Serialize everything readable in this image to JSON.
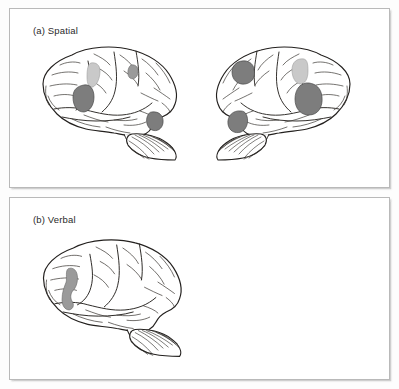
{
  "figure": {
    "background_color": "#fdfdfd",
    "panel_border_color": "#b9b9b9",
    "panel_background": "#ffffff"
  },
  "panels": [
    {
      "id": "spatial",
      "label": "(a) Spatial",
      "brain_count": 2,
      "brains": [
        {
          "id": "spatial-left-hemisphere",
          "view": "lateral",
          "facing": "right",
          "activations": [
            {
              "region": "superior-parietal",
              "shade": "light",
              "color": "#c9c9c9"
            },
            {
              "region": "inferior-parietal",
              "shade": "dark",
              "color": "#7d7d7d"
            },
            {
              "region": "premotor-dorsal",
              "shade": "mid",
              "color": "#9a9a9a"
            },
            {
              "region": "occipital-extrastriate",
              "shade": "dark",
              "color": "#7d7d7d"
            }
          ]
        },
        {
          "id": "spatial-right-hemisphere",
          "view": "lateral",
          "facing": "left",
          "activations": [
            {
              "region": "superior-parietal",
              "shade": "light",
              "color": "#c9c9c9"
            },
            {
              "region": "inferior-parietal",
              "shade": "dark",
              "color": "#7d7d7d"
            },
            {
              "region": "dorsolateral-prefrontal",
              "shade": "dark",
              "color": "#7d7d7d"
            },
            {
              "region": "occipital-extrastriate",
              "shade": "dark",
              "color": "#7d7d7d"
            }
          ]
        }
      ]
    },
    {
      "id": "verbal",
      "label": "(b) Verbal",
      "brain_count": 1,
      "brains": [
        {
          "id": "verbal-left-hemisphere",
          "view": "lateral",
          "facing": "right",
          "activations": [
            {
              "region": "broca-area-inferior-frontal",
              "shade": "mid",
              "color": "#9a9a9a"
            }
          ]
        }
      ]
    }
  ],
  "colors": {
    "activation_dark": "#7d7d7d",
    "activation_mid": "#9a9a9a",
    "activation_light": "#c9c9c9",
    "outline": "#23201e",
    "label_text": "#2a2a2a"
  }
}
